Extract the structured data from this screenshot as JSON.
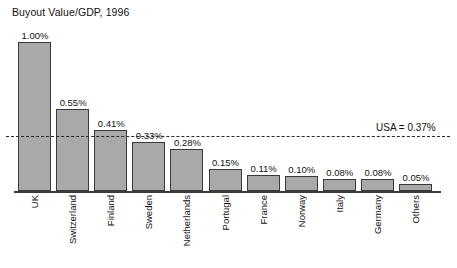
{
  "chart_data": {
    "type": "bar",
    "title": "Buyout Value/GDP, 1996",
    "xlabel": "",
    "ylabel": "",
    "ylim": [
      0,
      1.08
    ],
    "grid": false,
    "legend": "none",
    "value_suffix": "%",
    "categories": [
      "UK",
      "Switzerland",
      "Finland",
      "Sweden",
      "Netherlands",
      "Portugal",
      "France",
      "Norway",
      "Italy",
      "Germany",
      "Others"
    ],
    "values": [
      1.0,
      0.55,
      0.41,
      0.33,
      0.28,
      0.15,
      0.11,
      0.1,
      0.08,
      0.08,
      0.05
    ],
    "value_labels": [
      "1.00%",
      "0.55%",
      "0.41%",
      "0.33%",
      "0.28%",
      "0.15%",
      "0.11%",
      "0.10%",
      "0.08%",
      "0.08%",
      "0.05%"
    ],
    "annotations": [
      {
        "name": "usa-reference",
        "label": "USA = 0.37%",
        "value": 0.37,
        "style": "dashed-horizontal-line"
      }
    ],
    "colors": {
      "bar_fill": "#a9a9a9",
      "bar_border": "#3a3a3a",
      "axis": "#3a3a3a",
      "reference_line": "#2a2a2a",
      "text": "#111111",
      "background": "#ffffff"
    }
  },
  "caption": {
    "sliver_text": ""
  }
}
